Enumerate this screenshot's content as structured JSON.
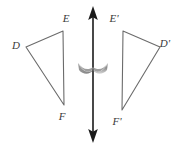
{
  "figure": {
    "background_color": "#ffffff",
    "stroke_color": "#6b6b6b",
    "label_color": "#3a3a3a",
    "axis_color": "#1a1a1a",
    "flip_arc_color": "#8d8d8d"
  },
  "shapes": {
    "left_triangle": {
      "name": "triangle-DEF",
      "vertices": [
        {
          "label": "D",
          "x": 26,
          "y": 47,
          "label_x": 16,
          "label_y": 46
        },
        {
          "label": "E",
          "x": 63,
          "y": 31,
          "label_x": 66,
          "label_y": 19
        },
        {
          "label": "F",
          "x": 64,
          "y": 105,
          "label_x": 62,
          "label_y": 117
        }
      ],
      "points": "26,47 63,31 64,105"
    },
    "right_triangle": {
      "name": "triangle-D-prime-E-prime-F-prime",
      "vertices": [
        {
          "label": "D'",
          "x": 160,
          "y": 47,
          "label_x": 165,
          "label_y": 44
        },
        {
          "label": "E'",
          "x": 123,
          "y": 31,
          "label_x": 114,
          "label_y": 19
        },
        {
          "label": "F'",
          "x": 122,
          "y": 110,
          "label_x": 117,
          "label_y": 122
        }
      ],
      "points": "160,47 123,31 122,110"
    }
  },
  "reflection_axis": {
    "name": "line-of-reflection",
    "x": 93,
    "y_top": 6,
    "y_bottom": 143,
    "arrowheads": "double"
  },
  "flip_indicator": {
    "name": "flip-arc",
    "center_x": 93,
    "center_y": 69,
    "width": 30,
    "height": 11
  },
  "labels": {
    "D": "D",
    "E": "E",
    "F": "F",
    "D_prime": "D'",
    "E_prime": "E'",
    "F_prime": "F'"
  }
}
